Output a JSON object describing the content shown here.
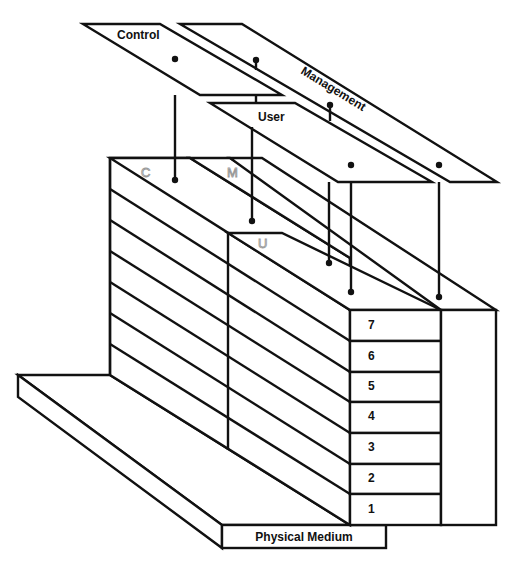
{
  "diagram": {
    "type": "layered-protocol-reference-model",
    "planes": [
      {
        "id": "control",
        "label": "Control",
        "letter": "C"
      },
      {
        "id": "management",
        "label": "Management",
        "letter": "M"
      },
      {
        "id": "user",
        "label": "User",
        "letter": "U"
      }
    ],
    "layers": [
      {
        "number": "7"
      },
      {
        "number": "6"
      },
      {
        "number": "5"
      },
      {
        "number": "4"
      },
      {
        "number": "3"
      },
      {
        "number": "2"
      },
      {
        "number": "1"
      }
    ],
    "base": {
      "label": "Physical Medium"
    },
    "colors": {
      "line": "#111111",
      "background": "#ffffff",
      "plane_letter_outline": "#9a9a9a"
    }
  }
}
